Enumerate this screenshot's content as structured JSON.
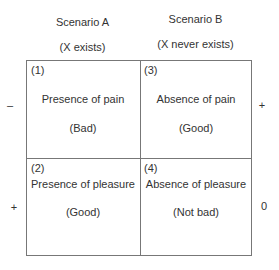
{
  "columns": [
    {
      "title": "Scenario A",
      "subtitle": "(X exists)"
    },
    {
      "title": "Scenario B",
      "subtitle": "(X never exists)"
    }
  ],
  "cells": [
    {
      "number": "(1)",
      "label": "Presence of pain",
      "value": "(Bad)"
    },
    {
      "number": "(3)",
      "label": "Absence of pain",
      "value": "(Good)"
    },
    {
      "number": "(2)",
      "label": "Presence of pleasure",
      "value": "(Good)"
    },
    {
      "number": "(4)",
      "label": "Absence of pleasure",
      "value": "(Not bad)"
    }
  ],
  "signs": {
    "row1_left": "–",
    "row1_right": "+",
    "row2_left": "+",
    "row2_right": "0"
  }
}
